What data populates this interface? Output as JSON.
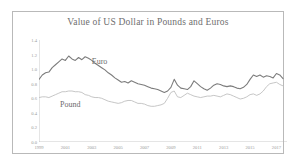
{
  "chart_data": {
    "type": "line",
    "title": "Value of US Dollar in Pounds and Euros",
    "xlabel": "",
    "ylabel": "",
    "xlim": [
      1999,
      2017.8
    ],
    "ylim": [
      0.0,
      1.4
    ],
    "grid": false,
    "legend": "inline-annotations",
    "xticks": [
      "1999",
      "2001",
      "2003",
      "2005",
      "2007",
      "2009",
      "2011",
      "2013",
      "2015",
      "2017"
    ],
    "xtick_values": [
      1999,
      2001,
      2003,
      2005,
      2007,
      2009,
      2011,
      2013,
      2015,
      2017
    ],
    "yticks": [
      "0.0",
      "0.2",
      "0.4",
      "0.6",
      "0.8",
      "1.0",
      "1.2",
      "1.4"
    ],
    "ytick_values": [
      0.0,
      0.2,
      0.4,
      0.6,
      0.8,
      1.0,
      1.2,
      1.4
    ],
    "annotations": [
      {
        "text": "Euro",
        "x": 2003.0,
        "y": 1.08
      },
      {
        "text": "Pound",
        "x": 2000.6,
        "y": 0.5
      }
    ],
    "series": [
      {
        "name": "Euro",
        "color": "#7c7c7c",
        "x": [
          1999.0,
          1999.25,
          1999.5,
          1999.75,
          2000.0,
          2000.25,
          2000.5,
          2000.75,
          2001.0,
          2001.25,
          2001.5,
          2001.75,
          2002.0,
          2002.25,
          2002.5,
          2002.75,
          2003.0,
          2003.25,
          2003.5,
          2003.75,
          2004.0,
          2004.25,
          2004.5,
          2004.75,
          2005.0,
          2005.25,
          2005.5,
          2005.75,
          2006.0,
          2006.25,
          2006.5,
          2006.75,
          2007.0,
          2007.25,
          2007.5,
          2007.75,
          2008.0,
          2008.25,
          2008.5,
          2008.75,
          2009.0,
          2009.25,
          2009.5,
          2009.75,
          2010.0,
          2010.25,
          2010.5,
          2010.75,
          2011.0,
          2011.25,
          2011.5,
          2011.75,
          2012.0,
          2012.25,
          2012.5,
          2012.75,
          2013.0,
          2013.25,
          2013.5,
          2013.75,
          2014.0,
          2014.25,
          2014.5,
          2014.75,
          2015.0,
          2015.25,
          2015.5,
          2015.75,
          2016.0,
          2016.25,
          2016.5,
          2016.75,
          2017.0,
          2017.25,
          2017.5
        ],
        "y": [
          0.86,
          0.92,
          0.95,
          0.96,
          1.02,
          1.06,
          1.1,
          1.14,
          1.12,
          1.18,
          1.14,
          1.12,
          1.16,
          1.13,
          1.17,
          1.15,
          1.12,
          1.08,
          1.05,
          1.02,
          0.99,
          0.95,
          0.92,
          0.88,
          0.85,
          0.82,
          0.83,
          0.81,
          0.84,
          0.82,
          0.8,
          0.79,
          0.78,
          0.76,
          0.74,
          0.73,
          0.72,
          0.7,
          0.68,
          0.7,
          0.75,
          0.86,
          0.78,
          0.74,
          0.73,
          0.72,
          0.76,
          0.84,
          0.8,
          0.76,
          0.73,
          0.71,
          0.74,
          0.78,
          0.8,
          0.79,
          0.77,
          0.76,
          0.77,
          0.76,
          0.74,
          0.73,
          0.75,
          0.79,
          0.86,
          0.92,
          0.9,
          0.92,
          0.89,
          0.91,
          0.9,
          0.88,
          0.94,
          0.92,
          0.87
        ]
      },
      {
        "name": "Pound",
        "color": "#c0c0c0",
        "x": [
          1999.0,
          1999.25,
          1999.5,
          1999.75,
          2000.0,
          2000.25,
          2000.5,
          2000.75,
          2001.0,
          2001.25,
          2001.5,
          2001.75,
          2002.0,
          2002.25,
          2002.5,
          2002.75,
          2003.0,
          2003.25,
          2003.5,
          2003.75,
          2004.0,
          2004.25,
          2004.5,
          2004.75,
          2005.0,
          2005.25,
          2005.5,
          2005.75,
          2006.0,
          2006.25,
          2006.5,
          2006.75,
          2007.0,
          2007.25,
          2007.5,
          2007.75,
          2008.0,
          2008.25,
          2008.5,
          2008.75,
          2009.0,
          2009.25,
          2009.5,
          2009.75,
          2010.0,
          2010.25,
          2010.5,
          2010.75,
          2011.0,
          2011.25,
          2011.5,
          2011.75,
          2012.0,
          2012.25,
          2012.5,
          2012.75,
          2013.0,
          2013.25,
          2013.5,
          2013.75,
          2014.0,
          2014.25,
          2014.5,
          2014.75,
          2015.0,
          2015.25,
          2015.5,
          2015.75,
          2016.0,
          2016.25,
          2016.5,
          2016.75,
          2017.0,
          2017.25,
          2017.5
        ],
        "y": [
          0.61,
          0.62,
          0.62,
          0.61,
          0.63,
          0.65,
          0.67,
          0.69,
          0.69,
          0.7,
          0.7,
          0.69,
          0.69,
          0.68,
          0.65,
          0.64,
          0.62,
          0.61,
          0.61,
          0.6,
          0.58,
          0.56,
          0.55,
          0.54,
          0.53,
          0.54,
          0.56,
          0.57,
          0.57,
          0.55,
          0.53,
          0.53,
          0.52,
          0.5,
          0.49,
          0.49,
          0.5,
          0.51,
          0.53,
          0.6,
          0.68,
          0.7,
          0.62,
          0.61,
          0.64,
          0.67,
          0.65,
          0.63,
          0.62,
          0.61,
          0.62,
          0.63,
          0.63,
          0.64,
          0.63,
          0.62,
          0.64,
          0.66,
          0.65,
          0.63,
          0.61,
          0.59,
          0.6,
          0.62,
          0.65,
          0.66,
          0.64,
          0.66,
          0.7,
          0.76,
          0.8,
          0.81,
          0.82,
          0.79,
          0.77
        ]
      }
    ]
  }
}
